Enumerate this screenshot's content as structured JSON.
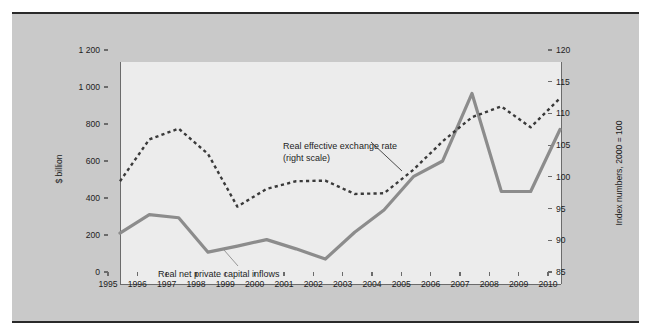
{
  "figure": {
    "background_color": "#c9c9c9",
    "plot_background_color": "#ececec",
    "series_solid_color": "#8c8c8c",
    "series_dashed_color": "#3a3a3a"
  },
  "chart_data": {
    "type": "line",
    "title": "",
    "subtitle": "",
    "xlabel": "",
    "ylabel": "$ billion",
    "y2label": "Index numbers, 2000 = 100",
    "grid": false,
    "legend_position": "in-plot annotations",
    "x": [
      1995,
      1996,
      1997,
      1998,
      1999,
      2000,
      2001,
      2002,
      2003,
      2004,
      2005,
      2006,
      2007,
      2008,
      2009,
      2010
    ],
    "xtick_labels": [
      "1995",
      "1996",
      "1997",
      "1998",
      "1999",
      "2000",
      "2001",
      "2002",
      "2003",
      "2004",
      "2005",
      "2006",
      "2007",
      "2008",
      "2009",
      "2010"
    ],
    "ylim": [
      0,
      1200
    ],
    "ytick_labels": [
      "0",
      "200",
      "400",
      "600",
      "800",
      "1 000",
      "1 200"
    ],
    "ytick_values": [
      0,
      200,
      400,
      600,
      800,
      1000,
      1200
    ],
    "y2lim": [
      85,
      120
    ],
    "y2tick_labels": [
      "85",
      "90",
      "95",
      "100",
      "105",
      "110",
      "115",
      "120"
    ],
    "y2tick_values": [
      85,
      90,
      95,
      100,
      105,
      110,
      115,
      120
    ],
    "series": [
      {
        "name": "Real net private capital inflows",
        "axis": "left",
        "style": "solid",
        "color": "#8c8c8c",
        "values": [
          275,
          375,
          358,
          172,
          205,
          240,
          190,
          135,
          280,
          400,
          580,
          665,
          1030,
          500,
          500,
          835
        ]
      },
      {
        "name": "Real effective exchange rate (right scale)",
        "axis": "right",
        "style": "dashed",
        "color": "#3a3a3a",
        "values": [
          101.2,
          107.8,
          109.5,
          105.5,
          97.2,
          100.0,
          101.2,
          101.3,
          99.2,
          99.3,
          103.0,
          107.5,
          111.3,
          113.0,
          109.7,
          114.3
        ]
      }
    ],
    "annotations": [
      {
        "id": "rer",
        "line1": "Real effective exchange rate",
        "line2": "(right scale)"
      },
      {
        "id": "flows",
        "line1": "Real net private capital inflows",
        "line2": ""
      }
    ]
  }
}
